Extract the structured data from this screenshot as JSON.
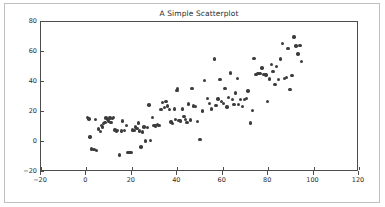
{
  "chart_data": {
    "type": "scatter",
    "title": "A Simple Scatterplot",
    "xlabel": "",
    "ylabel": "",
    "xlim": [
      -20,
      120
    ],
    "ylim": [
      -20,
      80
    ],
    "xticks": [
      -20,
      0,
      20,
      40,
      60,
      80,
      100,
      120
    ],
    "yticks": [
      -20,
      0,
      20,
      40,
      60,
      80
    ],
    "grid": false,
    "legend": null,
    "marker_color": "#3c3c3c",
    "marker_size": 3.4,
    "background_color": "#ffffff",
    "axis_color": "#4d4d4d",
    "series": [
      {
        "name": "points",
        "points": [
          [
            0.4,
            16.3
          ],
          [
            1.2,
            15.3
          ],
          [
            1.6,
            3.4
          ],
          [
            2.3,
            -4.6
          ],
          [
            3.3,
            -5.0
          ],
          [
            4.1,
            15.0
          ],
          [
            4.4,
            -5.8
          ],
          [
            5.4,
            8.8
          ],
          [
            6.1,
            7.0
          ],
          [
            6.6,
            11.1
          ],
          [
            7.0,
            10.0
          ],
          [
            7.4,
            12.3
          ],
          [
            8.2,
            13.0
          ],
          [
            8.6,
            16.0
          ],
          [
            9.3,
            15.0
          ],
          [
            9.8,
            14.0
          ],
          [
            10.4,
            16.1
          ],
          [
            10.9,
            13.2
          ],
          [
            11.5,
            15.6
          ],
          [
            12.0,
            16.2
          ],
          [
            12.6,
            8.0
          ],
          [
            13.2,
            7.2
          ],
          [
            13.8,
            7.5
          ],
          [
            14.6,
            -8.7
          ],
          [
            15.4,
            7.3
          ],
          [
            16.0,
            14.1
          ],
          [
            16.8,
            7.6
          ],
          [
            17.6,
            11.0
          ],
          [
            18.3,
            -6.8
          ],
          [
            19.1,
            -6.8
          ],
          [
            19.8,
            -7.0
          ],
          [
            20.4,
            8.0
          ],
          [
            21.0,
            7.5
          ],
          [
            21.6,
            10.0
          ],
          [
            22.2,
            9.0
          ],
          [
            22.8,
            12.6
          ],
          [
            23.4,
            7.3
          ],
          [
            24.0,
            -3.3
          ],
          [
            24.7,
            6.8
          ],
          [
            25.3,
            10.0
          ],
          [
            26.0,
            0.7
          ],
          [
            26.8,
            9.7
          ],
          [
            27.6,
            24.7
          ],
          [
            28.3,
            1.1
          ],
          [
            29.0,
            16.2
          ],
          [
            29.8,
            11.0
          ],
          [
            30.5,
            10.6
          ],
          [
            31.2,
            11.5
          ],
          [
            32.0,
            11.2
          ],
          [
            32.8,
            21.8
          ],
          [
            33.6,
            26.2
          ],
          [
            34.3,
            23.0
          ],
          [
            35.0,
            27.2
          ],
          [
            35.8,
            24.0
          ],
          [
            36.5,
            21.5
          ],
          [
            37.2,
            13.3
          ],
          [
            38.0,
            12.5
          ],
          [
            38.7,
            22.0
          ],
          [
            39.3,
            15.0
          ],
          [
            39.9,
            34.5
          ],
          [
            40.2,
            35.8
          ],
          [
            40.7,
            14.5
          ],
          [
            41.4,
            14.0
          ],
          [
            42.2,
            22.0
          ],
          [
            43.0,
            17.0
          ],
          [
            43.6,
            15.0
          ],
          [
            44.2,
            13.2
          ],
          [
            44.9,
            25.3
          ],
          [
            45.7,
            14.6
          ],
          [
            46.4,
            35.6
          ],
          [
            47.2,
            24.0
          ],
          [
            48.0,
            23.5
          ],
          [
            49.0,
            13.6
          ],
          [
            50.0,
            1.5
          ],
          [
            51.2,
            20.6
          ],
          [
            52.0,
            41.1
          ],
          [
            53.4,
            29.0
          ],
          [
            54.2,
            25.6
          ],
          [
            55.0,
            22.0
          ],
          [
            56.3,
            55.3
          ],
          [
            57.0,
            24.4
          ],
          [
            58.0,
            28.6
          ],
          [
            58.8,
            41.8
          ],
          [
            59.5,
            27.2
          ],
          [
            60.3,
            25.6
          ],
          [
            61.0,
            35.5
          ],
          [
            61.8,
            23.4
          ],
          [
            62.6,
            29.6
          ],
          [
            63.4,
            46.0
          ],
          [
            64.2,
            28.2
          ],
          [
            65.0,
            25.2
          ],
          [
            65.7,
            32.6
          ],
          [
            66.4,
            42.3
          ],
          [
            67.0,
            25.0
          ],
          [
            67.8,
            28.5
          ],
          [
            68.6,
            23.8
          ],
          [
            69.5,
            28.3
          ],
          [
            70.4,
            29.2
          ],
          [
            71.2,
            34.0
          ],
          [
            72.2,
            12.8
          ],
          [
            73.0,
            20.9
          ],
          [
            73.8,
            55.6
          ],
          [
            74.6,
            45.0
          ],
          [
            75.5,
            45.5
          ],
          [
            76.4,
            45.8
          ],
          [
            77.3,
            49.3
          ],
          [
            78.2,
            45.0
          ],
          [
            79.0,
            44.6
          ],
          [
            79.8,
            27.2
          ],
          [
            80.6,
            42.0
          ],
          [
            81.4,
            51.6
          ],
          [
            82.2,
            47.0
          ],
          [
            83.0,
            38.3
          ],
          [
            83.8,
            50.2
          ],
          [
            84.6,
            41.5
          ],
          [
            85.4,
            55.3
          ],
          [
            86.3,
            65.5
          ],
          [
            87.2,
            42.2
          ],
          [
            88.0,
            43.0
          ],
          [
            88.8,
            62.5
          ],
          [
            89.6,
            35.0
          ],
          [
            90.5,
            44.2
          ],
          [
            91.3,
            70.0
          ],
          [
            92.3,
            64.0
          ],
          [
            93.2,
            58.8
          ],
          [
            94.0,
            64.5
          ],
          [
            94.8,
            53.5
          ]
        ]
      }
    ]
  }
}
